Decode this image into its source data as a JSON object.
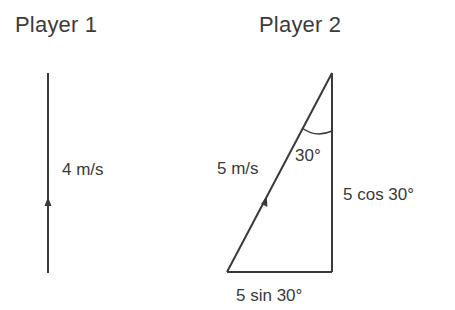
{
  "player1": {
    "title": "Player 1",
    "velocity_label": "4 m/s"
  },
  "player2": {
    "title": "Player 2",
    "hypotenuse_label": "5 m/s",
    "angle_label": "30°",
    "vertical_label": "5 cos 30°",
    "horizontal_label": "5 sin 30°"
  },
  "colors": {
    "line": "#3a3a3a",
    "text": "#3a3a3a",
    "background": "#ffffff"
  }
}
